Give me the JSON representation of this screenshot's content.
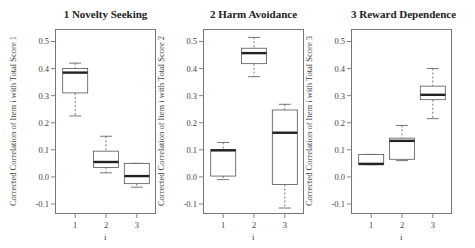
{
  "chart_data": [
    {
      "type": "box",
      "title": "1 Novelty Seeking",
      "xlabel": "i",
      "ylabel": "Corrected Correlation of Item i with Total Score 1",
      "categories": [
        "1",
        "2",
        "3"
      ],
      "yticks": [
        -0.1,
        0.0,
        0.1,
        0.2,
        0.3,
        0.4,
        0.5
      ],
      "ytick_labels": [
        "-0.1",
        "0.0",
        "0.1",
        "0.2",
        "0.3",
        "0.4",
        "0.5"
      ],
      "ylim": [
        -0.137,
        0.546
      ],
      "boxes": [
        {
          "category": "1",
          "whisker_low": 0.225,
          "q1": 0.31,
          "median": 0.385,
          "q3": 0.4,
          "whisker_high": 0.42
        },
        {
          "category": "2",
          "whisker_low": 0.015,
          "q1": 0.035,
          "median": 0.055,
          "q3": 0.095,
          "whisker_high": 0.15
        },
        {
          "category": "3",
          "whisker_low": -0.038,
          "q1": -0.025,
          "median": 0.003,
          "q3": 0.05,
          "whisker_high": 0.05
        }
      ]
    },
    {
      "type": "box",
      "title": "2 Harm Avoidance",
      "xlabel": "i",
      "ylabel": "Corrected Correlation of Item i with Total Score 2",
      "categories": [
        "1",
        "2",
        "3"
      ],
      "yticks": [
        -0.1,
        0.0,
        0.1,
        0.2,
        0.3,
        0.4,
        0.5
      ],
      "ytick_labels": [
        "-0.1",
        "0.0",
        "0.1",
        "0.2",
        "0.3",
        "0.4",
        "0.5"
      ],
      "ylim": [
        -0.137,
        0.546
      ],
      "boxes": [
        {
          "category": "1",
          "whisker_low": -0.01,
          "q1": 0.003,
          "median": 0.098,
          "q3": 0.1,
          "whisker_high": 0.127
        },
        {
          "category": "2",
          "whisker_low": 0.37,
          "q1": 0.418,
          "median": 0.457,
          "q3": 0.475,
          "whisker_high": 0.515
        },
        {
          "category": "3",
          "whisker_low": -0.115,
          "q1": -0.028,
          "median": 0.163,
          "q3": 0.247,
          "whisker_high": 0.268
        }
      ]
    },
    {
      "type": "box",
      "title": "3 Reward Dependence",
      "xlabel": "i",
      "ylabel": "Corrected Correlation of Item i with Total Score 3",
      "categories": [
        "1",
        "2",
        "3"
      ],
      "yticks": [
        -0.1,
        0.0,
        0.1,
        0.2,
        0.3,
        0.4,
        0.5
      ],
      "ytick_labels": [
        "-0.1",
        "0.0",
        "0.1",
        "0.2",
        "0.3",
        "0.4",
        "0.5"
      ],
      "ylim": [
        -0.137,
        0.546
      ],
      "boxes": [
        {
          "category": "1",
          "whisker_low": 0.045,
          "q1": 0.045,
          "median": 0.048,
          "q3": 0.083,
          "whisker_high": 0.083
        },
        {
          "category": "2",
          "whisker_low": 0.06,
          "q1": 0.065,
          "median": 0.133,
          "q3": 0.143,
          "whisker_high": 0.19
        },
        {
          "category": "3",
          "whisker_low": 0.215,
          "q1": 0.285,
          "median": 0.303,
          "q3": 0.335,
          "whisker_high": 0.4
        }
      ]
    }
  ],
  "panels": [
    {
      "title": "1 Novelty Seeking",
      "ylabel": "Corrected Correlation of Item i with Total Score 1",
      "xlabel": "i"
    },
    {
      "title": "2 Harm Avoidance",
      "ylabel": "Corrected Correlation of Item i with Total Score 2",
      "xlabel": "i"
    },
    {
      "title": "3 Reward Dependence",
      "ylabel": "Corrected Correlation of Item i with Total Score 3",
      "xlabel": "i"
    }
  ]
}
